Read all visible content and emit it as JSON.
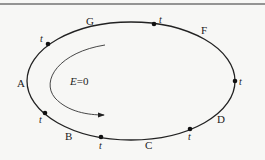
{
  "diagram": {
    "top_rule": {
      "y": 4
    },
    "ellipse": {
      "cx": 131,
      "cy": 81,
      "rx": 104,
      "ry": 59,
      "stroke": "#222222"
    },
    "center_label": {
      "text": "E=0",
      "var": "E",
      "rest": "=0"
    },
    "direction_arrow": {
      "description": "clockwise-curving arrow inside ellipse"
    },
    "region_labels": [
      {
        "id": "G",
        "text": "G",
        "x": 86,
        "y": 25
      },
      {
        "id": "F",
        "text": "F",
        "x": 201,
        "y": 34
      },
      {
        "id": "A",
        "text": "A",
        "x": 17,
        "y": 87
      },
      {
        "id": "B",
        "text": "B",
        "x": 65,
        "y": 140
      },
      {
        "id": "C",
        "text": "C",
        "x": 145,
        "y": 149
      },
      {
        "id": "D",
        "text": "D",
        "x": 217,
        "y": 123
      }
    ],
    "points": [
      {
        "label": "t",
        "x": 48,
        "y": 44,
        "lx": 40,
        "ly": 42
      },
      {
        "label": "t",
        "x": 154,
        "y": 24,
        "lx": 159,
        "ly": 23
      },
      {
        "label": "t",
        "x": 235,
        "y": 81,
        "lx": 239,
        "ly": 85
      },
      {
        "label": "t",
        "x": 190,
        "y": 129,
        "lx": 188,
        "ly": 140
      },
      {
        "label": "t",
        "x": 101,
        "y": 137,
        "lx": 99,
        "ly": 149
      },
      {
        "label": "t",
        "x": 45,
        "y": 113,
        "lx": 39,
        "ly": 123
      }
    ]
  }
}
